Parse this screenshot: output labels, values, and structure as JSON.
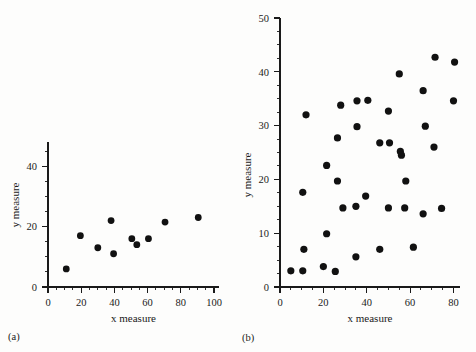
{
  "figure": {
    "background_color": "#fdfdfc",
    "marker_color": "#111111",
    "axis_color": "#1a1a1a"
  },
  "panels": [
    {
      "letter": "(a)",
      "xlabel": "x measure",
      "ylabel": "y measure"
    },
    {
      "letter": "(b)",
      "xlabel": "x measure",
      "ylabel": "y measure"
    }
  ],
  "chart_data": [
    {
      "type": "scatter",
      "title": "",
      "panel": "(a)",
      "xlabel": "x measure",
      "ylabel": "y measure",
      "xlim": [
        0,
        103
      ],
      "ylim": [
        0,
        48
      ],
      "xticks": [
        0,
        20,
        40,
        60,
        80,
        100
      ],
      "xtick_labels": [
        "0",
        "20",
        "40",
        "60",
        "80",
        "100"
      ],
      "x_minor_tick_step": 5,
      "yticks": [
        0,
        20,
        40
      ],
      "ytick_labels": [
        "0",
        "20",
        "40"
      ],
      "y_minor_tick_step": 5,
      "grid": false,
      "legend": false,
      "marker": "filled-circle",
      "n_points": 10,
      "points": [
        {
          "x": 11,
          "y": 6
        },
        {
          "x": 19.5,
          "y": 17
        },
        {
          "x": 30,
          "y": 13
        },
        {
          "x": 38,
          "y": 22
        },
        {
          "x": 39.5,
          "y": 11
        },
        {
          "x": 50.5,
          "y": 16
        },
        {
          "x": 53.5,
          "y": 14
        },
        {
          "x": 60.5,
          "y": 16
        },
        {
          "x": 70.5,
          "y": 21.5
        },
        {
          "x": 90.5,
          "y": 23
        }
      ]
    },
    {
      "type": "scatter",
      "title": "",
      "panel": "(b)",
      "xlabel": "x measure",
      "ylabel": "y measure",
      "xlim": [
        0,
        83
      ],
      "ylim": [
        0,
        50
      ],
      "xticks": [
        0,
        20,
        40,
        60,
        80
      ],
      "xtick_labels": [
        "0",
        "20",
        "40",
        "60",
        "80"
      ],
      "x_minor_tick_step": 5,
      "yticks": [
        0,
        10,
        20,
        30,
        40,
        50
      ],
      "ytick_labels": [
        "0",
        "10",
        "20",
        "30",
        "40",
        "50"
      ],
      "y_minor_tick_step": 2.5,
      "grid": false,
      "legend": false,
      "marker": "filled-circle",
      "n_points": 44,
      "points": [
        {
          "x": 5,
          "y": 3
        },
        {
          "x": 10.5,
          "y": 3
        },
        {
          "x": 11,
          "y": 7
        },
        {
          "x": 10.5,
          "y": 17.6
        },
        {
          "x": 12,
          "y": 32
        },
        {
          "x": 20,
          "y": 3.8
        },
        {
          "x": 21.5,
          "y": 9.9
        },
        {
          "x": 21.5,
          "y": 22.6
        },
        {
          "x": 25.5,
          "y": 2.9
        },
        {
          "x": 26.5,
          "y": 19.7
        },
        {
          "x": 26.5,
          "y": 27.7
        },
        {
          "x": 28,
          "y": 33.8
        },
        {
          "x": 29,
          "y": 14.7
        },
        {
          "x": 35,
          "y": 5.6
        },
        {
          "x": 35,
          "y": 15
        },
        {
          "x": 35.5,
          "y": 29.8
        },
        {
          "x": 35.5,
          "y": 34.6
        },
        {
          "x": 39.5,
          "y": 16.9
        },
        {
          "x": 40.5,
          "y": 34.7
        },
        {
          "x": 46,
          "y": 7
        },
        {
          "x": 46,
          "y": 26.8
        },
        {
          "x": 50,
          "y": 14.7
        },
        {
          "x": 50,
          "y": 32.7
        },
        {
          "x": 50.5,
          "y": 26.8
        },
        {
          "x": 55,
          "y": 39.6
        },
        {
          "x": 55.5,
          "y": 25.2
        },
        {
          "x": 56,
          "y": 24.5
        },
        {
          "x": 57.5,
          "y": 14.7
        },
        {
          "x": 58,
          "y": 19.7
        },
        {
          "x": 61.5,
          "y": 7.4
        },
        {
          "x": 66,
          "y": 13.6
        },
        {
          "x": 66,
          "y": 36.5
        },
        {
          "x": 67,
          "y": 29.9
        },
        {
          "x": 71,
          "y": 26
        },
        {
          "x": 71.5,
          "y": 42.7
        },
        {
          "x": 74.5,
          "y": 14.6
        },
        {
          "x": 80,
          "y": 34.6
        },
        {
          "x": 80.5,
          "y": 41.8
        }
      ]
    }
  ]
}
